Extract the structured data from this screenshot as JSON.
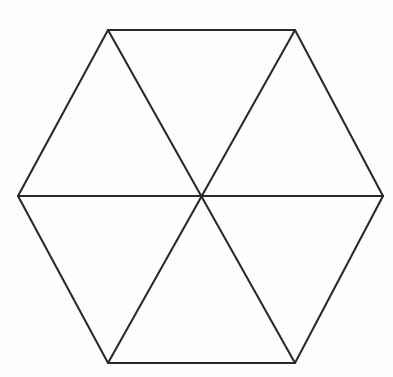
{
  "figure": {
    "name": "hexagon-divided-into-six-triangles",
    "canvas": {
      "width": 393,
      "height": 377,
      "background_color": "#fefefe"
    },
    "style": {
      "stroke_color": "#2b2b2b",
      "stroke_width": 2.1,
      "fill": "none",
      "line_cap": "round",
      "line_join": "miter"
    },
    "vertices": {
      "left": {
        "label": "left-vertex",
        "x": 18,
        "y": 196
      },
      "top_left": {
        "label": "top-left-vertex",
        "x": 108,
        "y": 30
      },
      "top_right": {
        "label": "top-right-vertex",
        "x": 295,
        "y": 30
      },
      "right": {
        "label": "right-vertex",
        "x": 383,
        "y": 196
      },
      "bottom_right": {
        "label": "bottom-right-vertex",
        "x": 295,
        "y": 363
      },
      "bottom_left": {
        "label": "bottom-left-vertex",
        "x": 108,
        "y": 363
      },
      "center": {
        "label": "center-point",
        "x": 201,
        "y": 196
      }
    },
    "outline_path": "M 18,196 L 108,30 L 295,30 L 383,196 L 295,363 L 108,363 Z",
    "diagonals": [
      {
        "name": "horizontal-diagonal",
        "from": "left",
        "to": "right",
        "path": "M 18,196 L 383,196"
      },
      {
        "name": "upper-left-to-lower-right-diagonal",
        "from": "top_left",
        "to": "bottom_right",
        "path": "M 108,30 L 295,363"
      },
      {
        "name": "upper-right-to-lower-left-diagonal",
        "from": "top_right",
        "to": "bottom_left",
        "path": "M 295,30 L 108,363"
      }
    ],
    "edges": [
      {
        "name": "edge-upper-left",
        "path": "M 18,196 L 108,30"
      },
      {
        "name": "edge-top",
        "path": "M 108,30 L 295,30"
      },
      {
        "name": "edge-upper-right",
        "path": "M 295,30 L 383,196"
      },
      {
        "name": "edge-lower-right",
        "path": "M 383,196 L 295,363"
      },
      {
        "name": "edge-bottom",
        "path": "M 295,363 L 108,363"
      },
      {
        "name": "edge-lower-left",
        "path": "M 108,363 L 18,196"
      }
    ],
    "triangle_count": 6,
    "triangles": [
      {
        "name": "triangle-top",
        "vertices": [
          "top_left",
          "top_right",
          "center"
        ]
      },
      {
        "name": "triangle-upper-right",
        "vertices": [
          "top_right",
          "right",
          "center"
        ]
      },
      {
        "name": "triangle-lower-right",
        "vertices": [
          "right",
          "bottom_right",
          "center"
        ]
      },
      {
        "name": "triangle-bottom",
        "vertices": [
          "bottom_right",
          "bottom_left",
          "center"
        ]
      },
      {
        "name": "triangle-lower-left",
        "vertices": [
          "bottom_left",
          "left",
          "center"
        ]
      },
      {
        "name": "triangle-upper-left",
        "vertices": [
          "left",
          "top_left",
          "center"
        ]
      }
    ]
  }
}
